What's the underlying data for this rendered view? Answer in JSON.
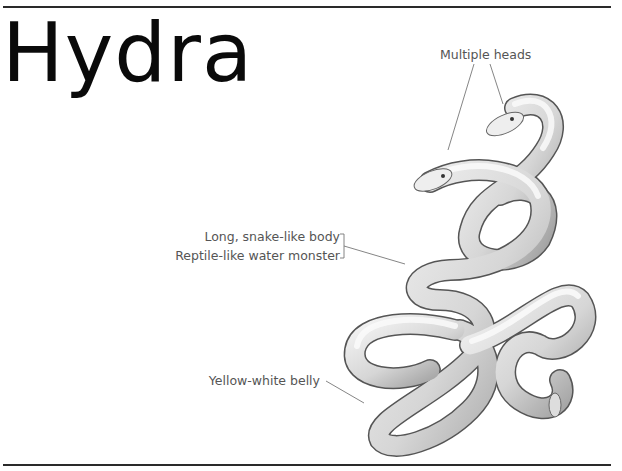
{
  "page": {
    "title": "Hydra"
  },
  "illustration": {
    "subject": "hydra-serpent",
    "annotations": [
      {
        "id": "heads",
        "text": "Multiple heads"
      },
      {
        "id": "body",
        "text": "Long, snake-like body"
      },
      {
        "id": "reptile",
        "text": "Reptile-like water monster"
      },
      {
        "id": "belly",
        "text": "Yellow-white belly"
      }
    ]
  },
  "colors": {
    "rule": "#2a2a2a",
    "title": "#0a0a0a",
    "label": "#555555",
    "leader": "#777777"
  }
}
